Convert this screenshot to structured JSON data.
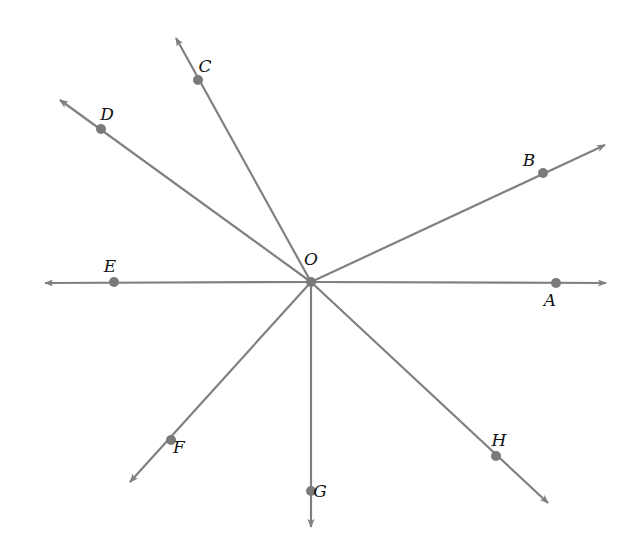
{
  "diagram": {
    "type": "rays-from-common-endpoint",
    "colors": {
      "line": "#808080",
      "point": "#7a7a7a",
      "label": "#111111",
      "background": "#ffffff"
    },
    "center": {
      "label": "O",
      "x": 311,
      "y": 282,
      "label_x": 311,
      "label_y": 265
    },
    "rays": [
      {
        "id": "A",
        "label": "A",
        "end": [
          606,
          283
        ],
        "point": [
          556,
          283
        ],
        "label_pos": [
          550,
          306
        ]
      },
      {
        "id": "B",
        "label": "B",
        "end": [
          605,
          145
        ],
        "point": [
          543,
          173
        ],
        "label_pos": [
          529,
          166
        ]
      },
      {
        "id": "C",
        "label": "C",
        "end": [
          176,
          38
        ],
        "point": [
          198,
          80
        ],
        "label_pos": [
          205,
          72
        ]
      },
      {
        "id": "D",
        "label": "D",
        "end": [
          60,
          100
        ],
        "point": [
          101,
          129
        ],
        "label_pos": [
          107,
          120
        ]
      },
      {
        "id": "E",
        "label": "E",
        "end": [
          45,
          283
        ],
        "point": [
          114,
          282
        ],
        "label_pos": [
          110,
          272
        ]
      },
      {
        "id": "F",
        "label": "F",
        "end": [
          130,
          482
        ],
        "point": [
          171,
          440
        ],
        "label_pos": [
          179,
          453
        ]
      },
      {
        "id": "G",
        "label": "G",
        "end": [
          311,
          527
        ],
        "point": [
          311,
          491
        ],
        "label_pos": [
          320,
          497
        ]
      },
      {
        "id": "H",
        "label": "H",
        "end": [
          548,
          503
        ],
        "point": [
          496,
          456
        ],
        "label_pos": [
          499,
          446
        ]
      }
    ]
  }
}
